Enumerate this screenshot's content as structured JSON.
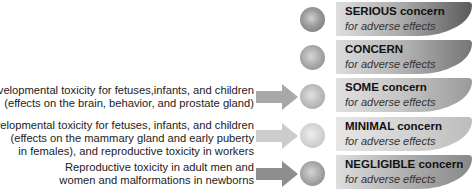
{
  "levels": [
    {
      "title": "SERIOUS concern",
      "subtitle": "for adverse effects",
      "banner_color_start": "#d8d8d8",
      "banner_color_end": "#5e5e5e",
      "circle_color": "#8a8a8a",
      "description": [],
      "arrow": false
    },
    {
      "title": "CONCERN",
      "subtitle": "for adverse effects",
      "banner_color_start": "#d6d6d6",
      "banner_color_end": "#7a7a7a",
      "circle_color": "#a0a0a0",
      "description": [],
      "arrow": false
    },
    {
      "title": "SOME concern",
      "subtitle": "for adverse effects",
      "banner_color_start": "#dddddd",
      "banner_color_end": "#9a9a9a",
      "circle_color": "#b4b4b4",
      "description": [
        "Developmental toxicity for fetuses,infants, and children",
        "(effects on the brain, behavior, and prostate gland)"
      ],
      "arrow": true,
      "arrow_color": "#a8a8a8"
    },
    {
      "title": "MINIMAL concern",
      "subtitle": "for adverse effects",
      "banner_color_start": "#e4e4e4",
      "banner_color_end": "#bdbdbd",
      "circle_color": "#cfcfcf",
      "description": [
        "Developmental toxicity for fetuses, infants, and children",
        "(effects on the mammary gland and early puberty",
        "in females), and reproductive toxicity in workers"
      ],
      "arrow": true,
      "arrow_color": "#c8c8c8"
    },
    {
      "title": "NEGLIGIBLE concern",
      "subtitle": "for adverse effects",
      "banner_color_start": "#dcdcdc",
      "banner_color_end": "#8c8c8c",
      "circle_color": "#9c9c9c",
      "description": [
        "Reproductive toxicity in adult men and",
        "women and malformations in newborns"
      ],
      "arrow": true,
      "arrow_color": "#8e8e8e"
    }
  ]
}
